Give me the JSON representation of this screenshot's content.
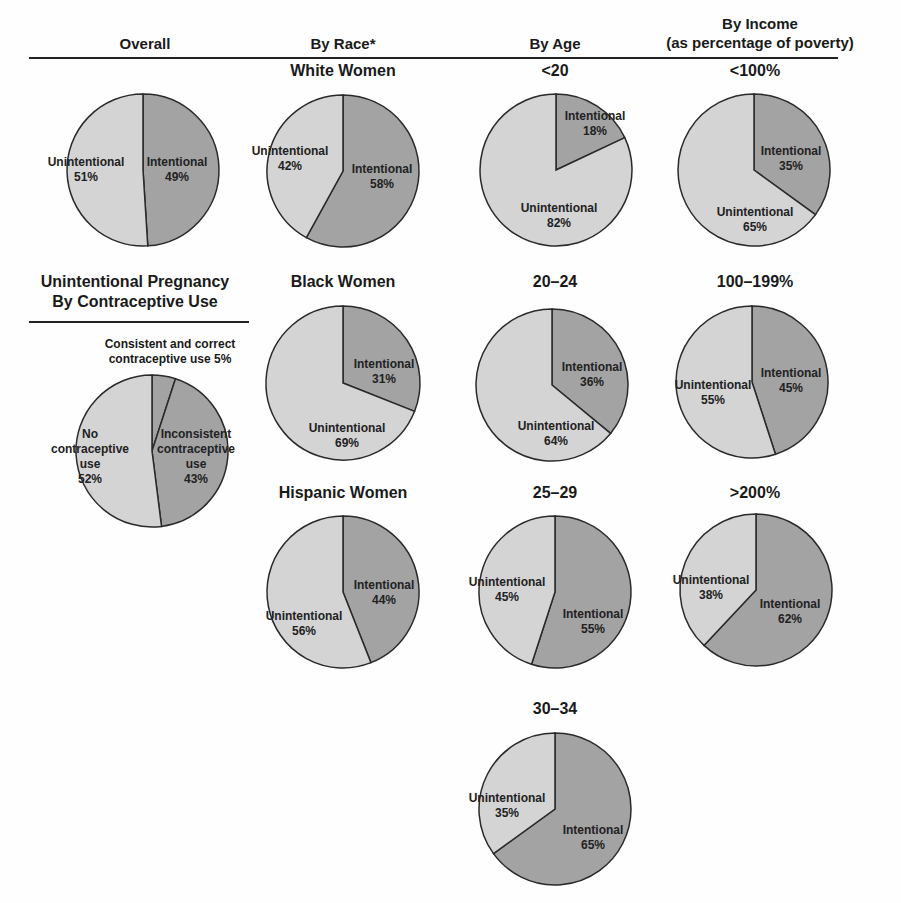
{
  "headers": {
    "overall": "Overall",
    "race": "By Race*",
    "age": "By Age",
    "income_line1": "By Income",
    "income_line2": "(as percentage of poverty)",
    "contraceptive_line1": "Unintentional Pregnancy",
    "contraceptive_line2": "By Contraceptive Use"
  },
  "colors": {
    "intentional": "#a3a3a3",
    "unintentional": "#d4d4d4",
    "outline": "#2a2a2a"
  },
  "chart_data": [
    {
      "type": "pie",
      "id": "overall",
      "title": "",
      "slices": [
        {
          "label": "Intentional",
          "value": 49
        },
        {
          "label": "Unintentional",
          "value": 51
        }
      ]
    },
    {
      "type": "pie",
      "id": "white",
      "title": "White Women",
      "slices": [
        {
          "label": "Intentional",
          "value": 58
        },
        {
          "label": "Unintentional",
          "value": 42
        }
      ]
    },
    {
      "type": "pie",
      "id": "black",
      "title": "Black Women",
      "slices": [
        {
          "label": "Intentional",
          "value": 31
        },
        {
          "label": "Unintentional",
          "value": 69
        }
      ]
    },
    {
      "type": "pie",
      "id": "hispanic",
      "title": "Hispanic Women",
      "slices": [
        {
          "label": "Intentional",
          "value": 44
        },
        {
          "label": "Unintentional",
          "value": 56
        }
      ]
    },
    {
      "type": "pie",
      "id": "age_lt20",
      "title": "<20",
      "slices": [
        {
          "label": "Intentional",
          "value": 18
        },
        {
          "label": "Unintentional",
          "value": 82
        }
      ]
    },
    {
      "type": "pie",
      "id": "age_20_24",
      "title": "20–24",
      "slices": [
        {
          "label": "Intentional",
          "value": 36
        },
        {
          "label": "Unintentional",
          "value": 64
        }
      ]
    },
    {
      "type": "pie",
      "id": "age_25_29",
      "title": "25–29",
      "slices": [
        {
          "label": "Intentional",
          "value": 55
        },
        {
          "label": "Unintentional",
          "value": 45
        }
      ]
    },
    {
      "type": "pie",
      "id": "age_30_34",
      "title": "30–34",
      "slices": [
        {
          "label": "Intentional",
          "value": 65
        },
        {
          "label": "Unintentional",
          "value": 35
        }
      ]
    },
    {
      "type": "pie",
      "id": "inc_lt100",
      "title": "<100%",
      "slices": [
        {
          "label": "Intentional",
          "value": 35
        },
        {
          "label": "Unintentional",
          "value": 65
        }
      ]
    },
    {
      "type": "pie",
      "id": "inc_100_199",
      "title": "100–199%",
      "slices": [
        {
          "label": "Intentional",
          "value": 45
        },
        {
          "label": "Unintentional",
          "value": 55
        }
      ]
    },
    {
      "type": "pie",
      "id": "inc_gt200",
      "title": ">200%",
      "slices": [
        {
          "label": "Intentional",
          "value": 62
        },
        {
          "label": "Unintentional",
          "value": 38
        }
      ]
    },
    {
      "type": "pie",
      "id": "contraceptive",
      "title": "Unintentional Pregnancy By Contraceptive Use",
      "slices": [
        {
          "label": "Consistent and correct contraceptive use",
          "value": 5
        },
        {
          "label": "Inconsistent contraceptive use",
          "value": 43
        },
        {
          "label": "No contraceptive use",
          "value": 52
        }
      ]
    }
  ],
  "pies": {
    "overall": {
      "cx": 143,
      "cy": 170,
      "r": 76,
      "intentional": 49,
      "int_label": [
        "Intentional",
        "49%"
      ],
      "int_pos": [
        177,
        166
      ],
      "unint_label": [
        "Unintentional",
        "51%"
      ],
      "unint_pos": [
        86,
        166
      ]
    },
    "white": {
      "cx": 343,
      "cy": 171,
      "r": 76,
      "title": "White Women",
      "title_y": 90,
      "intentional": 58,
      "int_label": [
        "Intentional",
        "58%"
      ],
      "int_pos": [
        382,
        173
      ],
      "unint_label": [
        "Unintentional",
        "42%"
      ],
      "unint_pos": [
        290,
        155
      ]
    },
    "black": {
      "cx": 343,
      "cy": 383,
      "r": 77,
      "title": "Black Women",
      "title_y": 290,
      "intentional": 31,
      "int_label": [
        "Intentional",
        "31%"
      ],
      "int_pos": [
        384,
        368
      ],
      "unint_label": [
        "Unintentional",
        "69%"
      ],
      "unint_pos": [
        347,
        432
      ]
    },
    "hispanic": {
      "cx": 343,
      "cy": 592,
      "r": 76,
      "title": "Hispanic Women",
      "title_y": 500,
      "intentional": 44,
      "int_label": [
        "Intentional",
        "44%"
      ],
      "int_pos": [
        384,
        589
      ],
      "unint_label": [
        "Unintentional",
        "56%"
      ],
      "unint_pos": [
        304,
        620
      ]
    },
    "age_lt20": {
      "cx": 556,
      "cy": 170,
      "r": 76,
      "title": "<20",
      "title_y": 90,
      "intentional": 18,
      "int_label": [
        "Intentional",
        "18%"
      ],
      "int_pos": [
        595,
        120
      ],
      "unint_label": [
        "Unintentional",
        "82%"
      ],
      "unint_pos": [
        559,
        212
      ]
    },
    "age_20_24": {
      "cx": 552,
      "cy": 385,
      "r": 76,
      "title": "20–24",
      "title_y": 290,
      "intentional": 36,
      "int_label": [
        "Intentional",
        "36%"
      ],
      "int_pos": [
        592,
        371
      ],
      "unint_label": [
        "Unintentional",
        "64%"
      ],
      "unint_pos": [
        556,
        430
      ]
    },
    "age_25_29": {
      "cx": 555,
      "cy": 592,
      "r": 76,
      "title": "25–29",
      "title_y": 500,
      "intentional": 55,
      "int_label": [
        "Intentional",
        "55%"
      ],
      "int_pos": [
        593,
        618
      ],
      "unint_label": [
        "Unintentional",
        "45%"
      ],
      "unint_pos": [
        507,
        586
      ]
    },
    "age_30_34": {
      "cx": 555,
      "cy": 809,
      "r": 76,
      "title": "30–34",
      "title_y": 718,
      "intentional": 65,
      "int_label": [
        "Intentional",
        "65%"
      ],
      "int_pos": [
        593,
        834
      ],
      "unint_label": [
        "Unintentional",
        "35%"
      ],
      "unint_pos": [
        507,
        802
      ]
    },
    "inc_lt100": {
      "cx": 754,
      "cy": 170,
      "r": 76,
      "title": "<100%",
      "title_y": 90,
      "intentional": 35,
      "int_label": [
        "Intentional",
        "35%"
      ],
      "int_pos": [
        791,
        155
      ],
      "unint_label": [
        "Unintentional",
        "65%"
      ],
      "unint_pos": [
        755,
        216
      ]
    },
    "inc_100_199": {
      "cx": 752,
      "cy": 382,
      "r": 76,
      "title": "100–199%",
      "title_y": 290,
      "intentional": 45,
      "int_label": [
        "Intentional",
        "45%"
      ],
      "int_pos": [
        791,
        377
      ],
      "unint_label": [
        "Unintentional",
        "55%"
      ],
      "unint_pos": [
        713,
        389
      ]
    },
    "inc_gt200": {
      "cx": 756,
      "cy": 590,
      "r": 76,
      "title": ">200%",
      "title_y": 500,
      "intentional": 62,
      "int_label": [
        "Intentional",
        "62%"
      ],
      "int_pos": [
        790,
        608
      ],
      "unint_label": [
        "Unintentional",
        "38%"
      ],
      "unint_pos": [
        711,
        584
      ]
    },
    "contraceptive": {
      "cx": 152,
      "cy": 451,
      "r": 76,
      "annotation": [
        "Consistent and correct",
        "contraceptive use 5%"
      ],
      "none_label": [
        "No",
        "contraceptive",
        "use",
        "52%"
      ],
      "none_pos": [
        90,
        438
      ],
      "inc_label": [
        "Inconsistent",
        "contraceptive",
        "use",
        "43%"
      ],
      "inc_pos": [
        196,
        438
      ]
    }
  }
}
